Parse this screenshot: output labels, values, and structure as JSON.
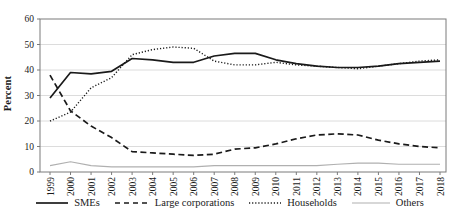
{
  "chart_data": {
    "type": "line",
    "title": "",
    "xlabel": "",
    "ylabel": "Percent",
    "ylim": [
      0,
      60
    ],
    "yticks": [
      0,
      10,
      20,
      30,
      40,
      50,
      60
    ],
    "grid": "horizontal-light",
    "legend_position": "bottom-center",
    "frame": true,
    "categories": [
      "1999",
      "2000",
      "2001",
      "2002",
      "2003",
      "2004",
      "2005",
      "2006",
      "2007",
      "2008",
      "2009",
      "2010",
      "2011",
      "2012",
      "2013",
      "2014",
      "2015",
      "2016",
      "2017",
      "2018"
    ],
    "series": [
      {
        "name": "SMEs",
        "line_style": "solid",
        "color": "#1a1a1a",
        "values": [
          29,
          39,
          38.5,
          39.5,
          44.5,
          44,
          43,
          43,
          45.5,
          46.5,
          46.5,
          44,
          42.5,
          41.5,
          41,
          41,
          41.5,
          42.5,
          43,
          43.5
        ]
      },
      {
        "name": "Large corporations",
        "line_style": "dashed",
        "color": "#1a1a1a",
        "values": [
          38,
          24,
          18,
          13.5,
          8,
          7.5,
          7,
          6.5,
          7,
          9,
          9.5,
          11,
          13,
          14.5,
          15,
          14.5,
          12.5,
          11,
          10,
          9.5
        ]
      },
      {
        "name": "Households",
        "line_style": "dotted",
        "color": "#1a1a1a",
        "values": [
          20,
          23.5,
          33,
          37,
          46,
          48,
          49,
          48.5,
          43.5,
          42,
          42,
          43,
          42,
          41.5,
          41,
          40.5,
          41.5,
          42.5,
          43.5,
          44
        ]
      },
      {
        "name": "Others",
        "line_style": "solid-thin",
        "color": "#b0b0b0",
        "values": [
          2.5,
          4,
          2.5,
          2,
          2,
          2,
          2,
          2,
          2.5,
          2.5,
          2.5,
          2.5,
          2.5,
          2.5,
          3,
          3.5,
          3.5,
          3,
          3,
          3
        ]
      }
    ],
    "colors": {
      "grid": "#dcdcdc",
      "frame": "#7a7a7a",
      "text": "#1a1a1a"
    }
  }
}
